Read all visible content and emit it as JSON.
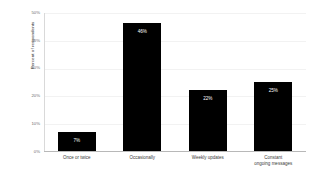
{
  "chart_data": {
    "type": "bar",
    "title": "",
    "xlabel": "",
    "ylabel": "Percent of respondents",
    "categories": [
      "Once or twice",
      "Occasionally",
      "Weekly updates",
      "Constant ongoing messages"
    ],
    "category_lines": [
      [
        "Once or twice"
      ],
      [
        "Occasionally"
      ],
      [
        "Weekly updates"
      ],
      [
        "Constant",
        "ongoing messages"
      ]
    ],
    "values": [
      7,
      46,
      22,
      25
    ],
    "value_labels": [
      "7%",
      "46%",
      "22%",
      "25%"
    ],
    "ylim": [
      0,
      50
    ],
    "yticks": [
      0,
      10,
      20,
      30,
      40,
      50
    ],
    "ytick_labels": [
      "0%",
      "10%",
      "20%",
      "30%",
      "40%",
      "50%"
    ],
    "grid": true,
    "legend": false,
    "bar_color": "#000000",
    "value_label_color": "#ffffff",
    "gridline_color": "#f2f2f2",
    "axis_color": "#b8b8b8",
    "background_color": "#ffffff"
  }
}
